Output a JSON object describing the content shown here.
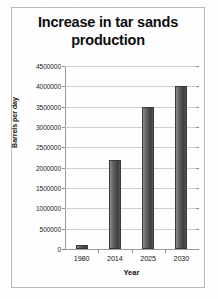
{
  "chart_data": {
    "type": "bar",
    "title": "Increase in tar sands production",
    "title_line1": "Increase in tar sands",
    "title_line2": "production",
    "xlabel": "Year",
    "ylabel": "Barrels per day",
    "categories": [
      "1980",
      "2014",
      "2025",
      "2030"
    ],
    "values": [
      100000,
      2200000,
      3500000,
      4000000
    ],
    "ylim": [
      0,
      4500000
    ],
    "ytick_labels": [
      "4500000",
      "4000000",
      "3500000",
      "3000000",
      "2500000",
      "2000000",
      "1500000",
      "1000000",
      "500000",
      "0"
    ],
    "ytick_values": [
      4500000,
      4000000,
      3500000,
      3000000,
      2500000,
      2000000,
      1500000,
      1000000,
      500000,
      0
    ],
    "grid": true,
    "legend": "none",
    "bar_color": "#4f4f4f",
    "gridline_color": "#cfcfcf",
    "axis_color": "#9a9a9a",
    "frame_color": "#b9b9b9"
  }
}
